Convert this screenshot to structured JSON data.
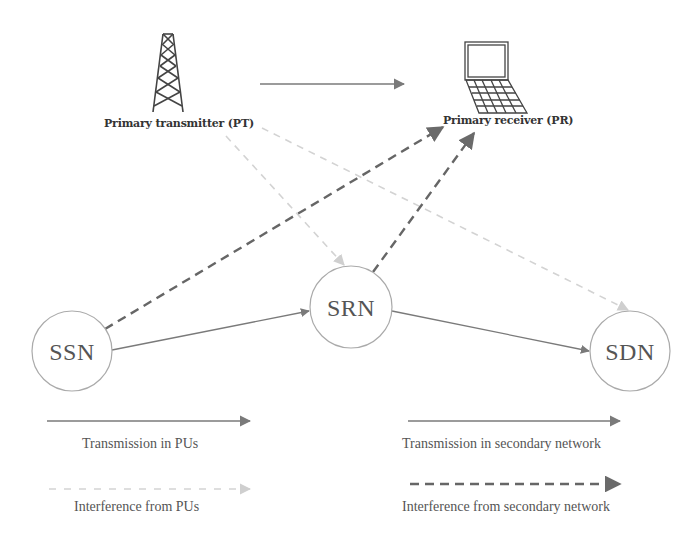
{
  "diagram": {
    "nodes": {
      "pt": {
        "label": "Primary transmitter (PT)",
        "icon": "tower-icon"
      },
      "pr": {
        "label": "Primary receiver (PR)",
        "icon": "laptop-icon"
      },
      "ssn": {
        "label": "SSN"
      },
      "srn": {
        "label": "SRN"
      },
      "sdn": {
        "label": "SDN"
      }
    },
    "edges": [
      {
        "from": "PT",
        "to": "PR",
        "type": "Transmission in PUs"
      },
      {
        "from": "SSN",
        "to": "PR",
        "type": "Interference from secondary network"
      },
      {
        "from": "SRN",
        "to": "PR",
        "type": "Interference from secondary network"
      },
      {
        "from": "PT",
        "to": "SRN",
        "type": "Interference from PUs"
      },
      {
        "from": "PT",
        "to": "SDN",
        "type": "Interference from PUs"
      },
      {
        "from": "SSN",
        "to": "SRN",
        "type": "Transmission in secondary network"
      },
      {
        "from": "SRN",
        "to": "SDN",
        "type": "Transmission in secondary network"
      }
    ],
    "legend": {
      "transmission_pu": "Transmission in PUs",
      "interference_pu": "Interference from PUs",
      "transmission_secondary": "Transmission in secondary network",
      "interference_secondary": "Interference from secondary network"
    },
    "colors": {
      "solid_line": "#777777",
      "dashed_dark": "#666666",
      "dashed_light": "#d0d0d0",
      "node_border": "#aaaaaa",
      "text": "#555555"
    }
  }
}
